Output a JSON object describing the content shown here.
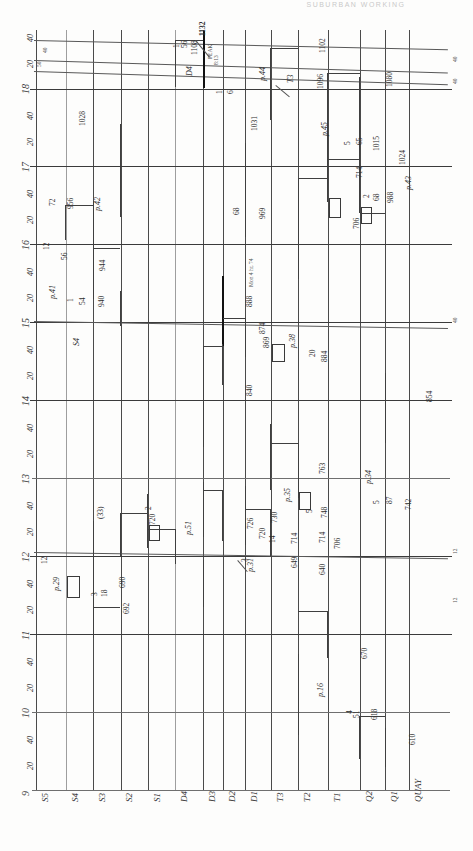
{
  "header": {
    "text": "SUBURBAN  WORKING"
  },
  "chart_data": {
    "type": "line",
    "xlabel": "Time (hours)",
    "ylabel": "Station",
    "grid": true,
    "legend_position": "none",
    "x_axis": {
      "orientation": "vertical-left",
      "range": [
        9,
        18.75
      ],
      "hour_ticks": [
        9,
        10,
        11,
        12,
        13,
        14,
        15,
        16,
        17,
        18
      ],
      "minor_tick_labels": [
        "20",
        "40"
      ],
      "minor_tick_minutes": [
        20,
        40
      ]
    },
    "y_axis": {
      "orientation": "horizontal-bottom",
      "categories": [
        "S5",
        "S4",
        "S3",
        "S2",
        "S1",
        "D4",
        "D3",
        "D2",
        "D1",
        "T3",
        "T2",
        "T1",
        "Q2",
        "Q1",
        "QUAY"
      ]
    },
    "station_labels": [
      "S5",
      "S4",
      "S3",
      "S2",
      "S1",
      "D4",
      "D3",
      "D2",
      "D1",
      "T3",
      "T2",
      "T1",
      "Q2",
      "Q1",
      "QUAY"
    ],
    "time_tick_labels": [
      "40",
      "18",
      "40",
      "20",
      "17",
      "40",
      "20",
      "16",
      "40",
      "20",
      "15",
      "40",
      "20",
      "14",
      "40",
      "20",
      "13",
      "40",
      "20",
      "12",
      "40",
      "20",
      "11",
      "40",
      "20",
      "10",
      "40",
      "20",
      "9"
    ],
    "train_numbers": [
      "1132",
      "1108",
      "1102",
      "1031",
      "1028",
      "1024",
      "1015",
      "1090",
      "988",
      "956",
      "944",
      "940",
      "888",
      "869",
      "854",
      "840",
      "792",
      "763",
      "748",
      "747",
      "742",
      "730",
      "726",
      "720",
      "714",
      "706",
      "692",
      "690",
      "670",
      "649",
      "640",
      "618",
      "610"
    ],
    "page_references": [
      "p.44",
      "p.45",
      "p.43",
      "p.42",
      "p.41",
      "p.38",
      "p.37",
      "p.35",
      "p.34",
      "p.31",
      "p.29",
      "p.26",
      "p.16"
    ],
    "cell_numbers": [
      "1",
      "2",
      "3",
      "4",
      "5",
      "12",
      "14",
      "18",
      "20",
      "51",
      "55",
      "56",
      "65",
      "68",
      "72",
      "87",
      "(33)"
    ],
    "note": "PEAK 8:13"
  },
  "annotations": [
    {
      "label": "1132",
      "kind": "train-number"
    },
    {
      "label": "1108",
      "kind": "train-number"
    },
    {
      "label": "1102",
      "kind": "train-number"
    },
    {
      "label": "PEAK",
      "kind": "note"
    },
    {
      "label": "8:13",
      "kind": "note"
    },
    {
      "label": "1",
      "kind": "cell-number"
    },
    {
      "label": "24",
      "kind": "cell-number"
    },
    {
      "label": "D4",
      "kind": "station-ref"
    },
    {
      "label": "p.44",
      "kind": "page-ref"
    },
    {
      "label": "T3",
      "kind": "station-ref"
    },
    {
      "label": "1096",
      "kind": "train-number"
    },
    {
      "label": "1080",
      "kind": "train-number"
    },
    {
      "label": "1028",
      "kind": "train-number"
    },
    {
      "label": "1031",
      "kind": "train-number"
    },
    {
      "label": "p.45",
      "kind": "page-ref"
    },
    {
      "label": "5",
      "kind": "cell-number"
    },
    {
      "label": "65",
      "kind": "cell-number"
    },
    {
      "label": "1015",
      "kind": "train-number"
    },
    {
      "label": "1024",
      "kind": "train-number"
    },
    {
      "label": "p.43",
      "kind": "page-ref"
    },
    {
      "label": "742",
      "kind": "train-number"
    },
    {
      "label": "2",
      "kind": "cell-number"
    },
    {
      "label": "56",
      "kind": "cell-number"
    },
    {
      "label": "988",
      "kind": "train-number"
    },
    {
      "label": "792",
      "kind": "train-number"
    },
    {
      "label": "72",
      "kind": "cell-number"
    },
    {
      "label": "956",
      "kind": "train-number"
    },
    {
      "label": "p.42",
      "kind": "page-ref"
    },
    {
      "label": "68",
      "kind": "cell-number"
    },
    {
      "label": "969",
      "kind": "train-number"
    },
    {
      "label": "12",
      "kind": "cell-number"
    },
    {
      "label": "55",
      "kind": "cell-number"
    },
    {
      "label": "944",
      "kind": "train-number"
    },
    {
      "label": "p.41",
      "kind": "page-ref"
    },
    {
      "label": "1",
      "kind": "cell-number"
    },
    {
      "label": "54",
      "kind": "cell-number"
    },
    {
      "label": "940",
      "kind": "train-number"
    },
    {
      "label": "888",
      "kind": "train-number"
    },
    {
      "label": "S4",
      "kind": "station-ref"
    },
    {
      "label": "874",
      "kind": "train-number"
    },
    {
      "label": "869",
      "kind": "train-number"
    },
    {
      "label": "p.38",
      "kind": "page-ref"
    },
    {
      "label": "20",
      "kind": "cell-number"
    },
    {
      "label": "854",
      "kind": "train-number"
    },
    {
      "label": "884",
      "kind": "train-number"
    },
    {
      "label": "840",
      "kind": "train-number"
    },
    {
      "label": "854",
      "kind": "train-number"
    },
    {
      "label": "763",
      "kind": "train-number"
    },
    {
      "label": "p.34",
      "kind": "page-ref"
    },
    {
      "label": "5",
      "kind": "cell-number"
    },
    {
      "label": "87",
      "kind": "cell-number"
    },
    {
      "label": "747",
      "kind": "train-number"
    },
    {
      "label": "p.35",
      "kind": "page-ref"
    },
    {
      "label": "5",
      "kind": "cell-number"
    },
    {
      "label": "748",
      "kind": "train-number"
    },
    {
      "label": "730",
      "kind": "train-number"
    },
    {
      "label": "714",
      "kind": "train-number"
    },
    {
      "label": "706",
      "kind": "train-number"
    },
    {
      "label": "726",
      "kind": "train-number"
    },
    {
      "label": "14",
      "kind": "cell-number"
    },
    {
      "label": "3",
      "kind": "cell-number"
    },
    {
      "label": "649",
      "kind": "train-number"
    },
    {
      "label": "p.31",
      "kind": "page-ref"
    },
    {
      "label": "640",
      "kind": "train-number"
    },
    {
      "label": "720",
      "kind": "train-number"
    },
    {
      "label": "(33)",
      "kind": "cell-number"
    },
    {
      "label": "2",
      "kind": "cell-number"
    },
    {
      "label": "p.51",
      "kind": "page-ref"
    },
    {
      "label": "12",
      "kind": "cell-number"
    },
    {
      "label": "p.29",
      "kind": "page-ref"
    },
    {
      "label": "3",
      "kind": "cell-number"
    },
    {
      "label": "18",
      "kind": "cell-number"
    },
    {
      "label": "690",
      "kind": "train-number"
    },
    {
      "label": "692",
      "kind": "train-number"
    },
    {
      "label": "670",
      "kind": "train-number"
    },
    {
      "label": "p.16",
      "kind": "page-ref"
    },
    {
      "label": "4",
      "kind": "cell-number"
    },
    {
      "label": "51",
      "kind": "cell-number"
    },
    {
      "label": "618",
      "kind": "train-number"
    },
    {
      "label": "610",
      "kind": "train-number"
    }
  ],
  "colors": {
    "ink": "#3a3a3a",
    "grid": "#8e8e8e",
    "paper": "#fdfdfc",
    "faint": "#c9c9c9"
  }
}
